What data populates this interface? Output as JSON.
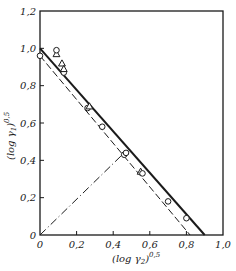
{
  "chart_data": {
    "type": "scatter",
    "title": "",
    "xlabel": "(log γ2)^0,5",
    "ylabel": "(log γ1)^0,5",
    "xlabel_parts": {
      "base": "(log γ",
      "sub": "2",
      "close": ")",
      "sup": "0,5"
    },
    "ylabel_parts": {
      "base": "(log γ",
      "sub": "1",
      "close": ")",
      "sup": "0,5"
    },
    "xlim": [
      0,
      1.0
    ],
    "ylim": [
      0,
      1.2
    ],
    "grid": false,
    "x_ticks": [
      {
        "value": 0,
        "label": "0"
      },
      {
        "value": 0.2,
        "label": "0,2"
      },
      {
        "value": 0.4,
        "label": "0,4"
      },
      {
        "value": 0.6,
        "label": "0,6"
      },
      {
        "value": 0.8,
        "label": "0,8"
      },
      {
        "value": 1.0,
        "label": "1,0"
      }
    ],
    "y_ticks": [
      {
        "value": 0,
        "label": "0"
      },
      {
        "value": 0.2,
        "label": "0,2"
      },
      {
        "value": 0.4,
        "label": "0,4"
      },
      {
        "value": 0.6,
        "label": "0,6"
      },
      {
        "value": 0.8,
        "label": "0,8"
      },
      {
        "value": 1.0,
        "label": "1,0"
      },
      {
        "value": 1.2,
        "label": "1,2"
      }
    ],
    "series": [
      {
        "name": "circles",
        "marker": "circle",
        "points": [
          [
            0.0,
            0.96
          ],
          [
            0.13,
            0.87
          ],
          [
            0.26,
            0.68
          ],
          [
            0.34,
            0.58
          ],
          [
            0.46,
            0.43
          ],
          [
            0.7,
            0.18
          ],
          [
            0.8,
            0.09
          ]
        ]
      },
      {
        "name": "triangles",
        "marker": "triangle",
        "points": [
          [
            0.09,
            0.97
          ],
          [
            0.12,
            0.92
          ],
          [
            0.13,
            0.89
          ],
          [
            0.27,
            0.69
          ],
          [
            0.55,
            0.34
          ]
        ]
      },
      {
        "name": "open-marker-extra",
        "marker": "circle",
        "points": [
          [
            0.09,
            0.99
          ],
          [
            0.47,
            0.44
          ],
          [
            0.56,
            0.33
          ]
        ]
      }
    ],
    "lines": [
      {
        "name": "solid-fit",
        "style": "solid",
        "from": [
          0.0,
          1.0
        ],
        "to": [
          0.9,
          0.0
        ]
      },
      {
        "name": "dashed-fit",
        "style": "dashed",
        "from": [
          0.0,
          0.96
        ],
        "to": [
          0.82,
          0.0
        ]
      },
      {
        "name": "dash-dot-diagonal",
        "style": "dashdot",
        "from": [
          0.0,
          0.0
        ],
        "to": [
          0.46,
          0.44
        ]
      }
    ]
  },
  "colors": {
    "ink": "#1a1a1a",
    "background": "#ffffff"
  }
}
